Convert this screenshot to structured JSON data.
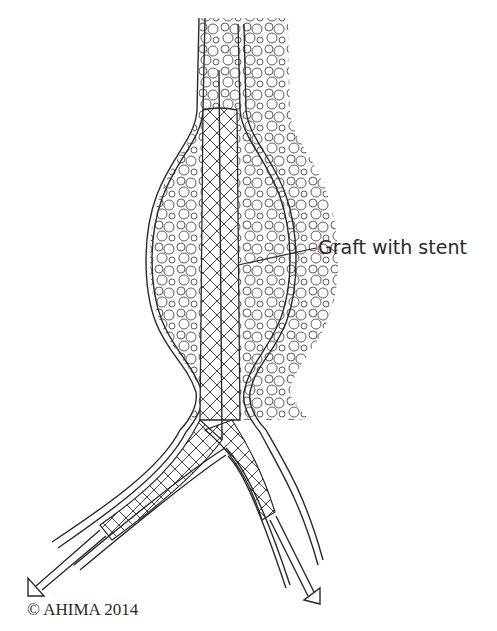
{
  "diagram": {
    "labels": {
      "graft": "Graft with stent"
    },
    "copyright": "© AHIMA 2014",
    "colors": {
      "stroke": "#2a2a2a",
      "background": "#ffffff"
    }
  }
}
